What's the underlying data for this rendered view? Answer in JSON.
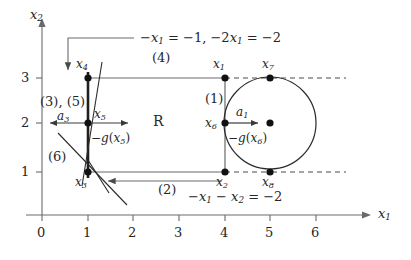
{
  "figure": {
    "type": "linear-programming-feasible-region-diagram",
    "axes": {
      "x_label": "x1",
      "y_label": "x2",
      "x_ticks": [
        "0",
        "1",
        "2",
        "3",
        "4",
        "5",
        "6"
      ],
      "y_ticks": [
        "1",
        "2",
        "3"
      ],
      "origin_label": "0"
    },
    "region_label": "R",
    "constraints": [
      {
        "id": "c-top",
        "label": "-x1 = -1, -2x1 = -2"
      },
      {
        "id": "c-bottom",
        "label": "-x1 - x2 = -2"
      }
    ],
    "step_markers": [
      {
        "id": "m1",
        "label": "(1)"
      },
      {
        "id": "m2",
        "label": "(2)"
      },
      {
        "id": "m35",
        "label": "(3), (5)"
      },
      {
        "id": "m4",
        "label": "(4)"
      },
      {
        "id": "m6",
        "label": "(6)"
      }
    ],
    "points": [
      {
        "name": "x1",
        "label": "x1",
        "x": 4,
        "y": 3
      },
      {
        "name": "x2",
        "label": "x2",
        "x": 4,
        "y": 1
      },
      {
        "name": "x3",
        "label": "x3",
        "x": 1,
        "y": 1
      },
      {
        "name": "x4",
        "label": "x4",
        "x": 1,
        "y": 3
      },
      {
        "name": "x5",
        "label": "x5",
        "x": 1,
        "y": 2
      },
      {
        "name": "x6",
        "label": "x6",
        "x": 4,
        "y": 2
      },
      {
        "name": "x7",
        "label": "x7",
        "x": 5,
        "y": 3
      },
      {
        "name": "x8",
        "label": "x8",
        "x": 5,
        "y": 1
      },
      {
        "name": "circle-center",
        "label": "",
        "x": 5,
        "y": 2
      }
    ],
    "vectors": [
      {
        "id": "a1",
        "label": "a1"
      },
      {
        "id": "a3",
        "label": "a3"
      }
    ],
    "gradients": [
      {
        "id": "g-x5",
        "label": "-g(x5)"
      },
      {
        "id": "g-x6",
        "label": "-g(x6)"
      }
    ],
    "circle": {
      "center_x": 5,
      "center_y": 2,
      "radius": 1
    },
    "colors": {
      "ink": "#262626",
      "line": "#4a4a4a",
      "dash": "#4a4a4a"
    }
  }
}
